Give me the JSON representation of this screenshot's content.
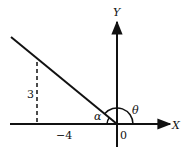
{
  "diagram": {
    "type": "coordinate-angle-figure",
    "axes": {
      "x_label": "X",
      "y_label": "Y",
      "origin_label": "0"
    },
    "labels": {
      "vertical_segment": "3",
      "horizontal_segment": "−4",
      "angle_alpha": "α",
      "angle_theta": "θ"
    },
    "colors": {
      "stroke": "#111111",
      "background": "#ffffff"
    }
  }
}
